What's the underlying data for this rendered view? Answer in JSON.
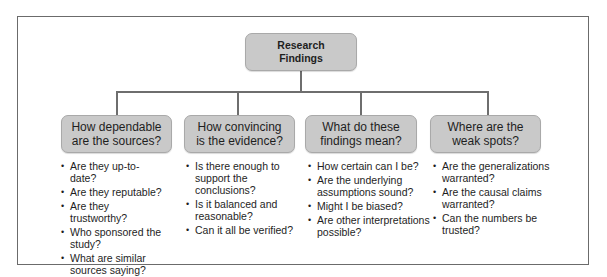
{
  "diagram": {
    "root": {
      "label": "Research\nFindings"
    },
    "branches": [
      {
        "label": "How dependable\nare the sources?",
        "questions": [
          "Are they up-to-date?",
          "Are they reputable?",
          "Are they trustworthy?",
          "Who sponsored the study?",
          "What are similar sources saying?"
        ]
      },
      {
        "label": "How convincing\nis the evidence?",
        "questions": [
          "Is there enough to support the conclusions?",
          "Is it balanced and reasonable?",
          "Can it all be verified?"
        ]
      },
      {
        "label": "What do these\nfindings mean?",
        "questions": [
          "How certain can I be?",
          "Are the underlying assumptions sound?",
          "Might I be biased?",
          "Are other interpretations possible?"
        ]
      },
      {
        "label": "Where are the\nweak spots?",
        "questions": [
          "Are the generalizations warranted?",
          "Are the causal claims warranted?",
          "Can the numbers be trusted?"
        ]
      }
    ],
    "colors": {
      "box_fill": "#c9c9c9",
      "line": "#6e6e6e",
      "frame": "#6b6b6b"
    }
  }
}
